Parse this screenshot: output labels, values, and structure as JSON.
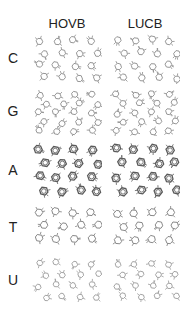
{
  "figure": {
    "columns": [
      "HOVB",
      "LUCB"
    ],
    "rows": [
      {
        "label": "C",
        "molecule": "cytosine",
        "top": 34,
        "height": 50,
        "pattern": "sparse",
        "ringSize": 3.4,
        "density": 16,
        "stroke": "#8a8a8a"
      },
      {
        "label": "G",
        "molecule": "guanine",
        "top": 90,
        "height": 46,
        "pattern": "sparse",
        "ringSize": 3.2,
        "density": 18,
        "stroke": "#8a8a8a"
      },
      {
        "label": "A",
        "molecule": "adenine",
        "top": 142,
        "height": 56,
        "pattern": "dense",
        "ringSize": 4.2,
        "density": 14,
        "stroke": "#5a5a5a"
      },
      {
        "label": "T",
        "molecule": "thymine",
        "top": 206,
        "height": 40,
        "pattern": "sparse",
        "ringSize": 3.8,
        "density": 10,
        "stroke": "#7a7a7a"
      },
      {
        "label": "U",
        "molecule": "uracil",
        "top": 258,
        "height": 44,
        "pattern": "grid",
        "ringSize": 3.0,
        "density": 16,
        "stroke": "#9a9a9a"
      }
    ]
  }
}
